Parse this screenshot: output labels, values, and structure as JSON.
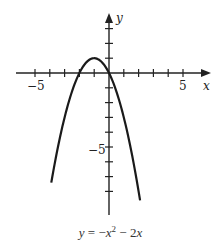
{
  "chart_data": {
    "type": "line",
    "title": "",
    "caption": "y = −x² − 2x",
    "caption_parts": {
      "lhs": "y",
      "eq": " = −",
      "x": "x",
      "exp": "2",
      "rest": " − 2",
      "x2": "x"
    },
    "xlabel": "x",
    "ylabel": "y",
    "xlim": [
      -5.5,
      6
    ],
    "ylim": [
      -9.5,
      4
    ],
    "x_ticks": [
      -5,
      -4,
      -3,
      -2,
      -1,
      1,
      2,
      3,
      4,
      5
    ],
    "y_ticks": [
      3,
      2,
      1,
      -1,
      -2,
      -3,
      -4,
      -5,
      -6,
      -7,
      -8
    ],
    "x_tick_labels": {
      "-5": "−5",
      "5": "5"
    },
    "y_tick_labels": {
      "-5": "−5"
    },
    "grid": false,
    "series": [
      {
        "name": "y = -x^2 - 2x",
        "x": [
          -3.9,
          -3.5,
          -3,
          -2.5,
          -2,
          -1.5,
          -1,
          -0.5,
          0,
          0.5,
          1,
          1.5,
          2.1
        ],
        "y": [
          -7.41,
          -5.25,
          -3,
          -1.25,
          0,
          0.75,
          1,
          0.75,
          0,
          -1.25,
          -3,
          -5.25,
          -8.61
        ]
      }
    ],
    "color": "#1a1a1a"
  },
  "labels": {
    "x_axis": "x",
    "y_axis": "y",
    "x_neg5": "−5",
    "x_pos5": "5",
    "y_neg5": "−5"
  }
}
